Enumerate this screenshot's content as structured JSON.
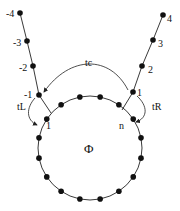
{
  "diagram": {
    "ring": {
      "label": "Φ",
      "center": [
        90,
        148
      ],
      "radius": 52,
      "site_count": 16,
      "first_site_label": "1",
      "last_site_label": "n"
    },
    "left_chain": {
      "labels": [
        "-1",
        "-2",
        "-3",
        "-4"
      ],
      "points": [
        [
          39,
          95
        ],
        [
          33,
          66
        ],
        [
          27,
          41
        ],
        [
          20,
          13
        ]
      ]
    },
    "right_chain": {
      "labels": [
        "1",
        "2",
        "3",
        "4"
      ],
      "points": [
        [
          133,
          92
        ],
        [
          142,
          66
        ],
        [
          153,
          40
        ],
        [
          163,
          15
        ]
      ]
    },
    "hoppings": {
      "tc": "tc",
      "tL": "tL",
      "tR": "tR"
    },
    "colors": {
      "line": "#222222",
      "node": "#111111",
      "background": "#ffffff"
    }
  }
}
